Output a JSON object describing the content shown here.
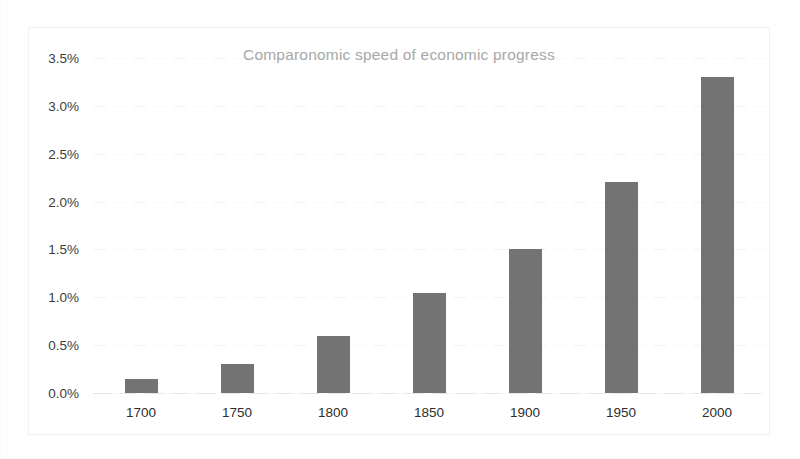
{
  "chart_data": {
    "type": "bar",
    "title": "Comparonomic speed of economic progress",
    "xlabel": "",
    "ylabel": "",
    "categories": [
      "1700",
      "1750",
      "1800",
      "1850",
      "1900",
      "1950",
      "2000"
    ],
    "values": [
      0.15,
      0.3,
      0.6,
      1.05,
      1.5,
      2.2,
      3.3
    ],
    "value_unit": "percent",
    "ylim": [
      0.0,
      3.5
    ],
    "ytick_values": [
      0.0,
      0.5,
      1.0,
      1.5,
      2.0,
      2.5,
      3.0,
      3.5
    ],
    "ytick_labels": [
      "0.0%",
      "0.5%",
      "1.0%",
      "1.5%",
      "2.0%",
      "2.5%",
      "3.0%",
      "3.5%"
    ],
    "xtick_labels": [
      "1700",
      "1750",
      "1800",
      "1850",
      "1900",
      "1950",
      "2000"
    ],
    "grid": true,
    "grid_axis": "y",
    "legend": false,
    "series": [
      {
        "name": "Comparonomic speed of economic progress",
        "values": [
          0.15,
          0.3,
          0.6,
          1.05,
          1.5,
          2.2,
          3.3
        ]
      }
    ]
  },
  "colors": {
    "bar": "#737373",
    "title_text": "#a8a8a8",
    "tick_text": "#2e2e2e",
    "gridline": "#ededed",
    "frame_border": "#f0f0f0",
    "background": "#ffffff"
  }
}
